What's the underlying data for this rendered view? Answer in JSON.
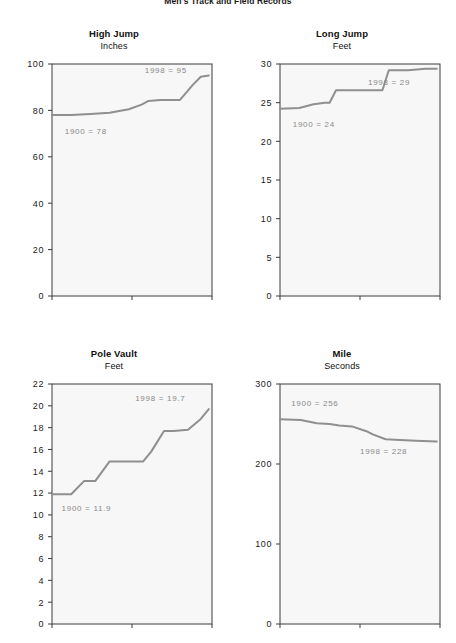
{
  "page": {
    "title": "Men's Track and Field Records"
  },
  "chart_data": [
    {
      "type": "line",
      "title": "High Jump",
      "subtitle": "Inches",
      "xlabel": "",
      "ylabel": "Inches",
      "xlim": [
        1900,
        2000
      ],
      "ylim": [
        0,
        100
      ],
      "xticks": [
        1900,
        1950,
        2000
      ],
      "xticklabels": [
        "1900",
        "1950",
        "2000"
      ],
      "yticks": [
        0,
        20,
        40,
        60,
        80,
        100
      ],
      "yticklabels": [
        "0",
        "20",
        "40",
        "60",
        "80",
        "100"
      ],
      "grid": false,
      "legend": "none",
      "line_color": "#8f8f8f",
      "plot_bg": "#f7f7f7",
      "annotations": [
        {
          "text": "1900 = 78",
          "x": 1908,
          "y": 70
        },
        {
          "text": "1998 = 95",
          "x": 1958,
          "y": 96
        }
      ],
      "x": [
        1900,
        1912,
        1924,
        1936,
        1948,
        1956,
        1960,
        1968,
        1980,
        1988,
        1993,
        1998
      ],
      "values": [
        78,
        78,
        78.5,
        79,
        80.5,
        82.5,
        84,
        84.5,
        84.5,
        91,
        94.5,
        95
      ]
    },
    {
      "type": "line",
      "title": "Long Jump",
      "subtitle": "Feet",
      "xlabel": "",
      "ylabel": "Feet",
      "xlim": [
        1900,
        2000
      ],
      "ylim": [
        0,
        30
      ],
      "xticks": [
        1900,
        1950,
        2000
      ],
      "xticklabels": [
        "1900",
        "1950",
        "2000"
      ],
      "yticks": [
        0,
        5,
        10,
        15,
        20,
        25,
        30
      ],
      "yticklabels": [
        "0",
        "5",
        "10",
        "15",
        "20",
        "25",
        "30"
      ],
      "grid": false,
      "legend": "none",
      "line_color": "#8f8f8f",
      "plot_bg": "#f7f7f7",
      "annotations": [
        {
          "text": "1900 = 24",
          "x": 1908,
          "y": 21.8
        },
        {
          "text": "1998 = 29",
          "x": 1955,
          "y": 27.3
        }
      ],
      "x": [
        1900,
        1912,
        1921,
        1928,
        1931,
        1935,
        1960,
        1964,
        1968,
        1980,
        1991,
        1998
      ],
      "values": [
        24.2,
        24.3,
        24.8,
        25.0,
        25.0,
        26.6,
        26.6,
        26.6,
        29.2,
        29.2,
        29.4,
        29.4
      ]
    },
    {
      "type": "line",
      "title": "Pole Vault",
      "subtitle": "Feet",
      "xlabel": "",
      "ylabel": "Feet",
      "xlim": [
        1900,
        2000
      ],
      "ylim": [
        0,
        22
      ],
      "xticks": [
        1900,
        1950,
        2000
      ],
      "xticklabels": [
        "1900",
        "1950",
        "2000"
      ],
      "yticks": [
        0,
        2,
        4,
        6,
        8,
        10,
        12,
        14,
        16,
        18,
        20,
        22
      ],
      "yticklabels": [
        "0",
        "2",
        "4",
        "6",
        "8",
        "10",
        "12",
        "14",
        "16",
        "18",
        "20",
        "22"
      ],
      "grid": false,
      "legend": "none",
      "line_color": "#8f8f8f",
      "plot_bg": "#f7f7f7",
      "annotations": [
        {
          "text": "1900 = 11.9",
          "x": 1906,
          "y": 10.4
        },
        {
          "text": "1998 = 19.7",
          "x": 1952,
          "y": 20.4
        }
      ],
      "x": [
        1900,
        1912,
        1920,
        1927,
        1936,
        1940,
        1957,
        1962,
        1970,
        1976,
        1985,
        1993,
        1998
      ],
      "values": [
        11.9,
        11.9,
        13.1,
        13.1,
        14.9,
        14.9,
        14.9,
        15.8,
        17.7,
        17.7,
        17.8,
        18.8,
        19.7
      ]
    },
    {
      "type": "line",
      "title": "Mile",
      "subtitle": "Seconds",
      "xlabel": "",
      "ylabel": "Seconds",
      "xlim": [
        1900,
        2000
      ],
      "ylim": [
        0,
        300
      ],
      "xticks": [
        1900,
        1950,
        2000
      ],
      "xticklabels": [
        "1900",
        "1950",
        "2000"
      ],
      "yticks": [
        0,
        100,
        200,
        300
      ],
      "yticklabels": [
        "0",
        "100",
        "200",
        "300"
      ],
      "grid": false,
      "legend": "none",
      "line_color": "#8f8f8f",
      "plot_bg": "#f7f7f7",
      "annotations": [
        {
          "text": "1900 = 256",
          "x": 1907,
          "y": 272
        },
        {
          "text": "1998 = 228",
          "x": 1950,
          "y": 212
        }
      ],
      "x": [
        1900,
        1913,
        1923,
        1931,
        1937,
        1945,
        1954,
        1958,
        1966,
        1975,
        1985,
        1998
      ],
      "values": [
        256,
        255,
        251,
        250,
        248,
        247,
        241,
        237,
        231,
        230,
        229,
        228
      ]
    }
  ]
}
